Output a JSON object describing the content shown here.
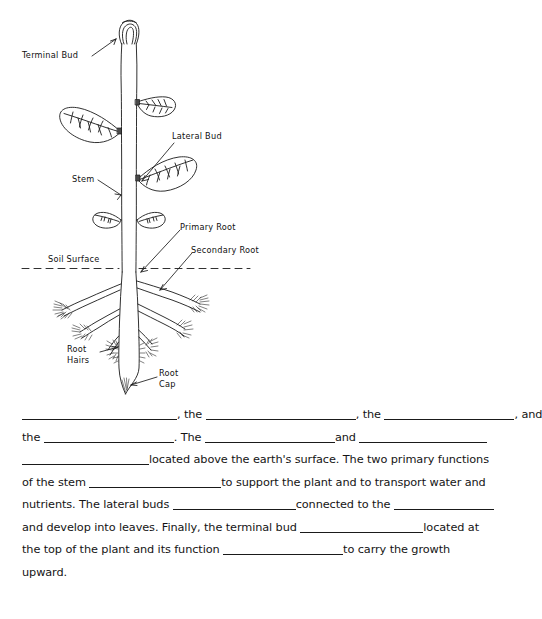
{
  "diagram": {
    "labels": [
      {
        "name": "terminal-bud",
        "text": "Terminal Bud",
        "x": 22,
        "y": 50
      },
      {
        "name": "lateral-bud",
        "text": "Lateral Bud",
        "x": 172,
        "y": 131
      },
      {
        "name": "stem",
        "text": "Stem",
        "x": 72,
        "y": 174
      },
      {
        "name": "primary-root",
        "text": "Primary Root",
        "x": 180,
        "y": 222
      },
      {
        "name": "secondary-root",
        "text": "Secondary Root",
        "x": 191,
        "y": 245
      },
      {
        "name": "soil-surface",
        "text": "Soil Surface",
        "x": 48,
        "y": 254
      },
      {
        "name": "root-hairs-line1",
        "text": "Root",
        "x": 67,
        "y": 344
      },
      {
        "name": "root-hairs-line2",
        "text": "Hairs",
        "x": 67,
        "y": 355
      },
      {
        "name": "root-cap-line1",
        "text": "Root",
        "x": 159,
        "y": 368
      },
      {
        "name": "root-cap-line2",
        "text": "Cap",
        "x": 159,
        "y": 379
      }
    ],
    "ink_color": "#1a1a1a"
  },
  "worksheet": {
    "lines": [
      {
        "id": "line-1",
        "parts": [
          {
            "type": "blank",
            "width": 155
          },
          {
            "type": "text",
            "value": ", the "
          },
          {
            "type": "blank",
            "width": 150
          },
          {
            "type": "text",
            "value": ", the "
          },
          {
            "type": "blank",
            "width": 130
          },
          {
            "type": "text",
            "value": ", and"
          }
        ]
      },
      {
        "id": "line-2",
        "parts": [
          {
            "type": "text",
            "value": "the "
          },
          {
            "type": "blank",
            "width": 130
          },
          {
            "type": "text",
            "value": ". The "
          },
          {
            "type": "blank",
            "width": 130
          },
          {
            "type": "text",
            "value": "and "
          },
          {
            "type": "blank",
            "width": 128
          }
        ]
      },
      {
        "id": "line-3",
        "parts": [
          {
            "type": "blank",
            "width": 127
          },
          {
            "type": "text",
            "value": "located above the earth's surface. The two primary functions"
          }
        ]
      },
      {
        "id": "line-4",
        "parts": [
          {
            "type": "text",
            "value": "of the stem "
          },
          {
            "type": "blank",
            "width": 132
          },
          {
            "type": "text",
            "value": "to support the plant and to transport water and"
          }
        ]
      },
      {
        "id": "line-5",
        "parts": [
          {
            "type": "text",
            "value": "nutrients. The lateral buds "
          },
          {
            "type": "blank",
            "width": 123
          },
          {
            "type": "text",
            "value": "connected to the "
          },
          {
            "type": "blank",
            "width": 100
          }
        ]
      },
      {
        "id": "line-6",
        "parts": [
          {
            "type": "text",
            "value": "and develop into leaves. Finally, the terminal bud "
          },
          {
            "type": "blank",
            "width": 123
          },
          {
            "type": "text",
            "value": "located at"
          }
        ]
      },
      {
        "id": "line-7",
        "parts": [
          {
            "type": "text",
            "value": "the top of the plant and its function "
          },
          {
            "type": "blank",
            "width": 120
          },
          {
            "type": "text",
            "value": "to carry the growth"
          }
        ]
      },
      {
        "id": "line-8",
        "parts": [
          {
            "type": "text",
            "value": "upward."
          }
        ]
      }
    ]
  }
}
